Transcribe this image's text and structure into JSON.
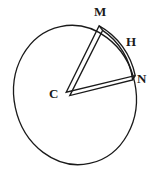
{
  "figure": {
    "kind": "circle-with-sector-diagram",
    "background_color": "#ffffff",
    "stroke_color": "#1a1a1a",
    "label_color": "#1a1a1a",
    "width": 155,
    "height": 172,
    "labels": {
      "center": "C",
      "arc_start": "M",
      "arc_midpoint": "H",
      "arc_end": "N"
    },
    "circle": {
      "center_x": 75,
      "center_y": 95,
      "radius_x": 62,
      "radius_y": 70,
      "rotation_deg": -12,
      "stroke_width": 1.2
    },
    "sector": {
      "vertex_x": 67,
      "vertex_y": 94,
      "point_m_x": 101,
      "point_m_y": 28,
      "point_n_x": 134,
      "point_n_y": 78,
      "outline_style": "double-line",
      "stroke_width": 1.2,
      "offset": 3
    }
  }
}
